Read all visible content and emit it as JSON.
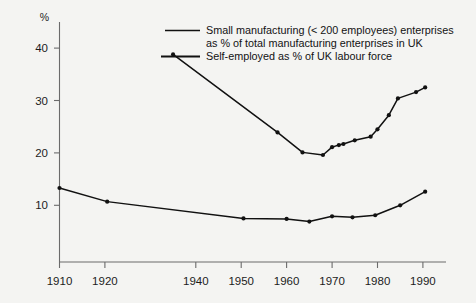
{
  "chart_data": {
    "type": "line",
    "title": "",
    "xlabel": "",
    "ylabel": "",
    "y_unit": "%",
    "xlim": [
      1910,
      1995
    ],
    "ylim": [
      0,
      44
    ],
    "grid": false,
    "legend_position": "top-center",
    "xticks": [
      1910,
      1920,
      1940,
      1950,
      1960,
      1970,
      1980,
      1990
    ],
    "xtick_labels": [
      "1910",
      "1920",
      "1940",
      "1950",
      "1960",
      "1970",
      "1980",
      "1990"
    ],
    "yticks": [
      10,
      20,
      30,
      40
    ],
    "ytick_labels": [
      "10",
      "20",
      "30",
      "40"
    ],
    "series": [
      {
        "name": "Small manufacturing (< 200 employees) enterprises as % of total manufacturing enterprises in UK",
        "legend_line1": "Small manufacturing (< 200 employees) enterprises",
        "legend_line2": "as % of total manufacturing enterprises in UK",
        "color": "#111111",
        "x": [
          1935,
          1958,
          1963.5,
          1968,
          1970,
          1971.5,
          1972.5,
          1975,
          1978.5,
          1980,
          1982.5,
          1984.5,
          1988.5,
          1990.5
        ],
        "values": [
          38.8,
          23.9,
          20.1,
          19.6,
          21.1,
          21.5,
          21.7,
          22.4,
          23.1,
          24.5,
          27.2,
          30.4,
          31.6,
          32.5
        ]
      },
      {
        "name": "Self-employed as % of UK labour force",
        "legend_line1": "Self-employed as % of UK labour force",
        "legend_line2": "",
        "color": "#111111",
        "x": [
          1910,
          1920.5,
          1950.5,
          1960,
          1965,
          1970,
          1974.5,
          1979.5,
          1985,
          1990.5
        ],
        "values": [
          13.3,
          10.7,
          7.5,
          7.4,
          6.9,
          7.9,
          7.7,
          8.1,
          10.0,
          12.6
        ]
      }
    ]
  },
  "legend": {
    "entries": [
      {
        "swatch": "line-swatch-thin",
        "line1": "Small manufacturing (< 200 employees) enterprises",
        "line2": "as % of total manufacturing enterprises in UK"
      },
      {
        "swatch": "line-swatch-thick",
        "line1": "Self-employed as % of UK labour force",
        "line2": ""
      }
    ]
  },
  "colors": {
    "background": "#f4f4f2",
    "axis": "#6b6b6b",
    "ink": "#111111"
  }
}
